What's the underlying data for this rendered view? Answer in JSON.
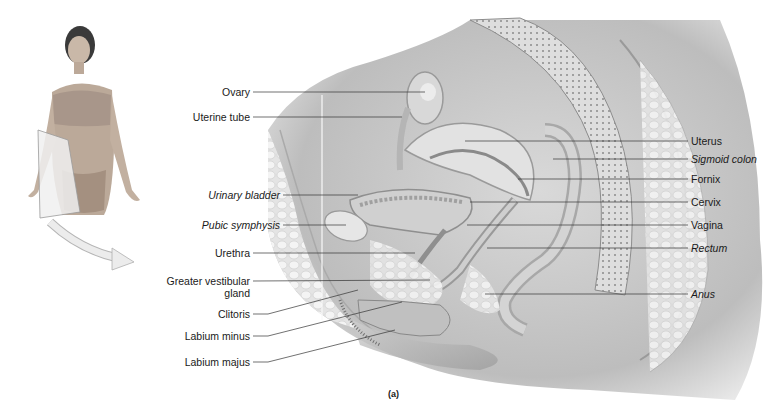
{
  "figure": {
    "caption": "(a)",
    "inset": {
      "description": "Standing female figure with sagittal cutting plane through pelvis",
      "arrow": "curved-arrow pointing to section"
    },
    "labels_left": [
      {
        "text": "Ovary",
        "italic": false
      },
      {
        "text": "Uterine tube",
        "italic": false
      },
      {
        "text": "Urinary bladder",
        "italic": true
      },
      {
        "text": "Pubic symphysis",
        "italic": true
      },
      {
        "text": "Urethra",
        "italic": false
      },
      {
        "text": "Greater vestibular",
        "text2": "gland",
        "italic": false
      },
      {
        "text": "Clitoris",
        "italic": false
      },
      {
        "text": "Labium minus",
        "italic": false
      },
      {
        "text": "Labium majus",
        "italic": false
      }
    ],
    "labels_right": [
      {
        "text": "Uterus",
        "italic": false
      },
      {
        "text": "Sigmoid colon",
        "italic": true
      },
      {
        "text": "Fornix",
        "italic": false
      },
      {
        "text": "Cervix",
        "italic": false
      },
      {
        "text": "Vagina",
        "italic": false
      },
      {
        "text": "Rectum",
        "italic": true
      },
      {
        "text": "Anus",
        "italic": true
      }
    ],
    "colors": {
      "line": "#333333",
      "tissue_light": "#e6e6e6",
      "tissue_mid": "#c8c8c8",
      "tissue_dark": "#9a9a9a"
    }
  }
}
